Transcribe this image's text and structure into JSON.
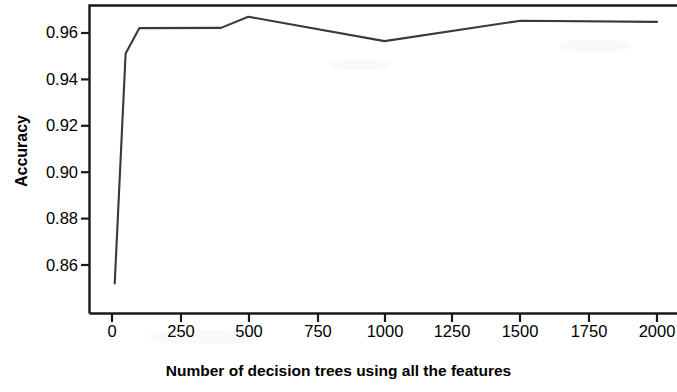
{
  "chart_data": {
    "type": "line",
    "title": "",
    "xlabel": "Number of decision trees using all the features",
    "ylabel": "Accuracy",
    "xlim": [
      -40,
      2040
    ],
    "ylim": [
      0.8484,
      0.9692
    ],
    "xticks": [
      0,
      250,
      500,
      750,
      1000,
      1250,
      1500,
      1750,
      2000
    ],
    "xtick_labels": [
      "0",
      "250",
      "500",
      "750",
      "1000",
      "1250",
      "1500",
      "1750",
      "2000"
    ],
    "yticks": [
      0.86,
      0.88,
      0.9,
      0.92,
      0.94,
      0.96
    ],
    "ytick_labels": [
      "0.86",
      "0.88",
      "0.90",
      "0.92",
      "0.94",
      "0.96"
    ],
    "grid": false,
    "legend": null,
    "line_color": "#3a3a3a",
    "x": [
      10,
      50,
      100,
      400,
      500,
      1000,
      1500,
      2000
    ],
    "values": [
      0.8521,
      0.9512,
      0.9621,
      0.9622,
      0.967,
      0.9565,
      0.9653,
      0.9648
    ],
    "series": [
      {
        "name": "Accuracy",
        "x": [
          10,
          50,
          100,
          400,
          500,
          1000,
          1500,
          2000
        ],
        "values": [
          0.8521,
          0.9512,
          0.9621,
          0.9622,
          0.967,
          0.9565,
          0.9653,
          0.9648
        ]
      }
    ],
    "annotations": []
  },
  "axes": {
    "frame_color": "#1a1a1a",
    "background": "#ffffff"
  }
}
